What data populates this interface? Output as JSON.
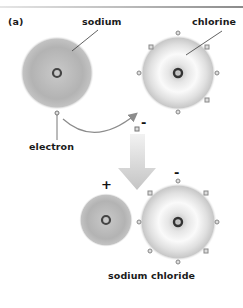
{
  "figure": {
    "panel_label": "(a)",
    "labels": {
      "sodium": "sodium",
      "chlorine": "chlorine",
      "electron": "electron",
      "product": "sodium chloride"
    },
    "charges": {
      "transferred_electron": "-",
      "sodium_ion": "+",
      "chloride_ion": "-"
    },
    "atoms": [
      {
        "name": "sodium",
        "outer_electrons": 1,
        "shading": "gray"
      },
      {
        "name": "chlorine",
        "outer_electrons": 7,
        "shading": "white-halo"
      }
    ],
    "ions": [
      {
        "name": "sodium ion",
        "charge": "+",
        "outer_electrons": 0
      },
      {
        "name": "chloride ion",
        "charge": "-",
        "outer_electrons": 8
      }
    ],
    "colors": {
      "sodium_fill": "#b5b5b5",
      "chlorine_halo": "#c4c4c4",
      "arrow_fill": "#cfcfcf",
      "text": "#1a1a1a",
      "leader_line": "#3a3a3a"
    }
  }
}
